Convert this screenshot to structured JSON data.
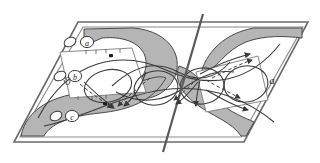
{
  "figure": {
    "background_color": "#ffffff",
    "stroke_color": "#3a3a3a",
    "plane_stroke_color": "#555555",
    "shade_fill": "#b5b5b5",
    "shade_stroke": "#4a4a4a",
    "dark_line_color": "#4f4f4f",
    "label_color": "#222222",
    "white_fill": "#ffffff"
  },
  "plane": {
    "name": "parallelogram-plane",
    "corners": [
      {
        "x": 78,
        "y": 22
      },
      {
        "x": 308,
        "y": 22
      },
      {
        "x": 244,
        "y": 142
      },
      {
        "x": 14,
        "y": 142
      }
    ],
    "inner_corners": [
      {
        "x": 83,
        "y": 26
      },
      {
        "x": 303,
        "y": 26
      },
      {
        "x": 241,
        "y": 138
      },
      {
        "x": 20,
        "y": 138
      }
    ]
  },
  "axis_line": {
    "name": "central-slanted-axis",
    "x1": 203,
    "y1": 14,
    "x2": 163,
    "y2": 152
  },
  "labels": [
    {
      "id": "label-a-top",
      "glyph": "a",
      "x": 86,
      "y": 46,
      "size": 9
    },
    {
      "id": "label-b-middle",
      "glyph": "b",
      "x": 72,
      "y": 78,
      "size": 9
    },
    {
      "id": "label-c-bottom",
      "glyph": "c",
      "x": 71,
      "y": 118,
      "size": 9
    },
    {
      "id": "label-a-right",
      "glyph": "a",
      "x": 272,
      "y": 80,
      "size": 10
    }
  ],
  "marker_dots": [
    {
      "id": "dot-upper-band",
      "x": 111,
      "y": 56
    },
    {
      "id": "dot-lower-band",
      "x": 105,
      "y": 104
    }
  ],
  "open_circles": [
    {
      "id": "basepoint-top",
      "cx": 70,
      "cy": 43,
      "rx": 6,
      "ry": 4.5,
      "rot": -28
    },
    {
      "id": "basepoint-middle",
      "cx": 60,
      "cy": 76,
      "rx": 6,
      "ry": 4.5,
      "rot": -28
    },
    {
      "id": "basepoint-bottom",
      "cx": 56,
      "cy": 115,
      "rx": 6,
      "ry": 4.5,
      "rot": -28
    }
  ],
  "circle_labels": [
    {
      "id": "circled-a-top",
      "cx": 86,
      "cy": 43,
      "r": 6
    },
    {
      "id": "circled-b-middle",
      "cx": 74,
      "cy": 76,
      "r": 6
    },
    {
      "id": "circled-c-bottom",
      "cx": 71,
      "cy": 115,
      "r": 6
    }
  ],
  "shaded_regions": [
    {
      "id": "left-upper-lobe",
      "path": "M 83 32 L 132 31 C 168 33 180 58 168 78 C 158 95 136 98 122 86 C 136 86 148 74 144 58 C 140 44 124 38 104 39 L 83 47 Z"
    },
    {
      "id": "left-lower-lobe",
      "path": "M 24 137 C 28 112 52 96 90 94 C 128 92 152 76 162 80 C 150 100 128 110 100 112 C 70 114 50 124 44 137 Z"
    },
    {
      "id": "right-upper-lobe",
      "path": "M 302 31 L 258 31 C 226 36 208 58 206 78 C 220 68 228 52 248 44 C 266 37 286 38 302 39 Z"
    },
    {
      "id": "right-lower-lobe",
      "path": "M 240 137 C 232 124 214 118 198 106 C 182 94 176 80 180 68 C 196 72 204 88 216 100 C 228 112 244 118 252 122 L 244 137 Z"
    }
  ],
  "braid_curves": [
    {
      "id": "strand-outer-upper",
      "path": "M 36 120 C 70 58 120 50 164 68 C 208 86 248 82 278 46"
    },
    {
      "id": "strand-outer-lower",
      "path": "M 42 126 C 80 118 118 96 160 90 C 204 84 240 96 272 120"
    },
    {
      "id": "strand-mid-1",
      "path": "M 112 88 C 136 64 158 62 176 72 C 196 82 212 80 228 64"
    },
    {
      "id": "strand-mid-2",
      "path": "M 116 92 C 142 104 164 100 182 88 C 202 74 216 70 232 72"
    },
    {
      "id": "loop-left",
      "path": "M 150 72 C 124 74 120 96 142 104 C 164 110 176 94 166 82 C 158 72 150 72 150 72 Z"
    },
    {
      "id": "loop-center",
      "path": "M 196 70 C 172 72 168 94 190 102 C 212 108 224 92 214 80 C 206 70 196 70 196 70 Z"
    },
    {
      "id": "loop-right",
      "path": "M 240 66 C 216 68 212 90 234 98 C 256 104 268 88 258 76 C 250 66 240 66 240 66 Z"
    },
    {
      "id": "loop-far-left",
      "path": "M 104 70 C 82 74 82 94 102 100 C 122 106 134 90 126 80 C 118 70 104 70 104 70 Z"
    }
  ],
  "dashed_arrows": [
    {
      "id": "arrow-left-1",
      "path": "M 78 82 C 92 92 104 100 114 108",
      "tip": {
        "x": 116,
        "y": 110,
        "angle": 40
      }
    },
    {
      "id": "arrow-left-2",
      "path": "M 152 78 C 138 88 126 98 116 106",
      "tip": {
        "x": 114,
        "y": 108,
        "angle": 140
      }
    },
    {
      "id": "arrow-mid-1",
      "path": "M 198 78 C 188 86 180 94 172 100",
      "tip": {
        "x": 170,
        "y": 102,
        "angle": 145
      }
    },
    {
      "id": "arrow-mid-2",
      "path": "M 206 80 C 220 88 232 94 242 98",
      "tip": {
        "x": 244,
        "y": 100,
        "angle": 25
      }
    },
    {
      "id": "arrow-right-1",
      "path": "M 210 78 C 226 70 240 64 254 60",
      "tip": {
        "x": 256,
        "y": 59,
        "angle": -18
      }
    },
    {
      "id": "arrow-right-2",
      "path": "M 212 84 C 226 92 238 100 250 106",
      "tip": {
        "x": 252,
        "y": 108,
        "angle": 28
      }
    }
  ],
  "solid_arrow_tips": [
    {
      "id": "tip-upper-right",
      "x": 256,
      "y": 56,
      "angle": -22
    },
    {
      "id": "tip-lower-right",
      "x": 252,
      "y": 112,
      "angle": 30
    },
    {
      "id": "tip-mid-left",
      "x": 118,
      "y": 110,
      "angle": 42
    },
    {
      "id": "tip-mid-center",
      "x": 176,
      "y": 104,
      "angle": 150
    }
  ]
}
